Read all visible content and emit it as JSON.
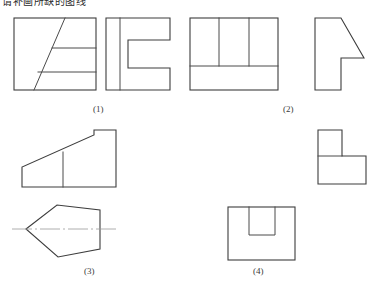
{
  "page": {
    "clipped_header_text": "请补画所缺的图线",
    "width": 376,
    "height": 293,
    "background": "#ffffff",
    "line_color": "#3d3d3d",
    "centerline_color": "#9a9a9a"
  },
  "labels": {
    "fig1": "(1)",
    "fig2": "(2)",
    "fig3": "(3)",
    "fig4": "(4)"
  },
  "figures": [
    {
      "id": "fig1",
      "label": "(1)",
      "views": [
        {
          "name": "fig1-view-left",
          "description": "rectangle with diagonal line and two horizontal lines"
        },
        {
          "name": "fig1-view-right",
          "description": "C-shaped bracket profile with vertical line near left edge"
        }
      ]
    },
    {
      "id": "fig2",
      "label": "(2)",
      "views": [
        {
          "name": "fig2-view-left",
          "description": "rectangle with lower horizontal line and two upper vertical lines"
        },
        {
          "name": "fig2-view-right",
          "description": "L-shape with diagonal chamfer at upper right"
        }
      ]
    },
    {
      "id": "fig3",
      "label": "(3)",
      "views": [
        {
          "name": "fig3-view-top",
          "description": "wedge ramp shape with raised block at right and vertical inner line"
        },
        {
          "name": "fig3-view-bottom",
          "description": "pentagon pointing left with horizontal centerline"
        }
      ]
    },
    {
      "id": "fig4",
      "label": "(4)",
      "views": [
        {
          "name": "fig4-view-top",
          "description": "step L-shape block"
        },
        {
          "name": "fig4-view-bottom",
          "description": "rectangle with U-shaped slot cut from top edge"
        }
      ]
    }
  ]
}
